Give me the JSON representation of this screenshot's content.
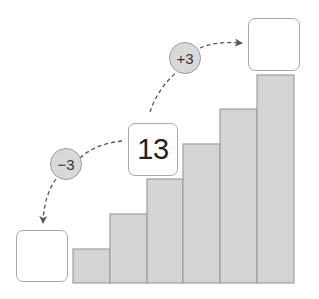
{
  "diagram": {
    "type": "staircase-number-pattern",
    "bars": {
      "count": 6,
      "fill": "#d7d7d7",
      "stroke": "#9e9e9e",
      "heights_px": [
        34,
        69,
        104,
        139,
        174,
        208
      ]
    },
    "boxes": {
      "left": {
        "value": ""
      },
      "middle": {
        "value": "13"
      },
      "right": {
        "value": ""
      }
    },
    "steps": {
      "down": {
        "label": "−3"
      },
      "up": {
        "label": "+3"
      }
    },
    "colors": {
      "circle_fill": "#d9d9d9",
      "arrow": "#555555",
      "box_border": "#a9a9a9"
    }
  }
}
